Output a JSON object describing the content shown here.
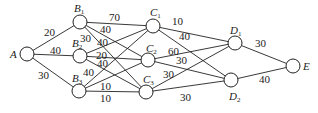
{
  "diagram": {
    "type": "weighted-graph",
    "nodes": [
      {
        "id": "A",
        "label": "A",
        "sub": "",
        "x": 27,
        "y": 54,
        "lx": 10,
        "ly": 58
      },
      {
        "id": "B1",
        "label": "B",
        "sub": "1",
        "x": 80,
        "y": 22,
        "lx": 74,
        "ly": 12
      },
      {
        "id": "B2",
        "label": "B",
        "sub": "2",
        "x": 80,
        "y": 56,
        "lx": 72,
        "ly": 47
      },
      {
        "id": "B3",
        "label": "B",
        "sub": "3",
        "x": 79,
        "y": 91,
        "lx": 72,
        "ly": 82
      },
      {
        "id": "C1",
        "label": "C",
        "sub": "1",
        "x": 153,
        "y": 26,
        "lx": 150,
        "ly": 16
      },
      {
        "id": "C2",
        "label": "C",
        "sub": "2",
        "x": 148,
        "y": 60,
        "lx": 146,
        "ly": 52
      },
      {
        "id": "C3",
        "label": "C",
        "sub": "3",
        "x": 146,
        "y": 92,
        "lx": 143,
        "ly": 83
      },
      {
        "id": "D1",
        "label": "D",
        "sub": "1",
        "x": 235,
        "y": 43,
        "lx": 230,
        "ly": 34
      },
      {
        "id": "D2",
        "label": "D",
        "sub": "2",
        "x": 231,
        "y": 80,
        "lx": 229,
        "ly": 100
      },
      {
        "id": "E",
        "label": "E",
        "sub": "",
        "x": 293,
        "y": 66,
        "lx": 303,
        "ly": 70
      }
    ],
    "edges": [
      {
        "from": "A",
        "to": "B1",
        "weight": "20",
        "lx": 44,
        "ly": 36
      },
      {
        "from": "A",
        "to": "B2",
        "weight": "40",
        "lx": 50,
        "ly": 54
      },
      {
        "from": "A",
        "to": "B3",
        "weight": "30",
        "lx": 38,
        "ly": 79
      },
      {
        "from": "B1",
        "to": "C1",
        "weight": "70",
        "lx": 109,
        "ly": 21
      },
      {
        "from": "B1",
        "to": "C2",
        "weight": "40",
        "lx": 100,
        "ly": 33
      },
      {
        "from": "B1",
        "to": "C3",
        "weight": "30",
        "lx": 80,
        "ly": 42
      },
      {
        "from": "B2",
        "to": "C1",
        "weight": "40",
        "lx": 97,
        "ly": 46
      },
      {
        "from": "B2",
        "to": "C2",
        "weight": "20",
        "lx": 96,
        "ly": 59
      },
      {
        "from": "B2",
        "to": "C3",
        "weight": "40",
        "lx": 97,
        "ly": 67
      },
      {
        "from": "B3",
        "to": "C1",
        "weight": "40",
        "lx": 83,
        "ly": 76
      },
      {
        "from": "B3",
        "to": "C2",
        "weight": "10",
        "lx": 100,
        "ly": 90
      },
      {
        "from": "B3",
        "to": "C3",
        "weight": "10",
        "lx": 100,
        "ly": 102
      },
      {
        "from": "C1",
        "to": "D1",
        "weight": "10",
        "lx": 172,
        "ly": 25
      },
      {
        "from": "C1",
        "to": "D2",
        "weight": "40",
        "lx": 179,
        "ly": 40
      },
      {
        "from": "C2",
        "to": "D1",
        "weight": "60",
        "lx": 168,
        "ly": 55
      },
      {
        "from": "C2",
        "to": "D2",
        "weight": "30",
        "lx": 176,
        "ly": 64
      },
      {
        "from": "C3",
        "to": "D1",
        "weight": "30",
        "lx": 163,
        "ly": 78
      },
      {
        "from": "C3",
        "to": "D2",
        "weight": "30",
        "lx": 180,
        "ly": 101
      },
      {
        "from": "D1",
        "to": "E",
        "weight": "30",
        "lx": 255,
        "ly": 47
      },
      {
        "from": "D2",
        "to": "E",
        "weight": "40",
        "lx": 259,
        "ly": 83
      }
    ]
  }
}
